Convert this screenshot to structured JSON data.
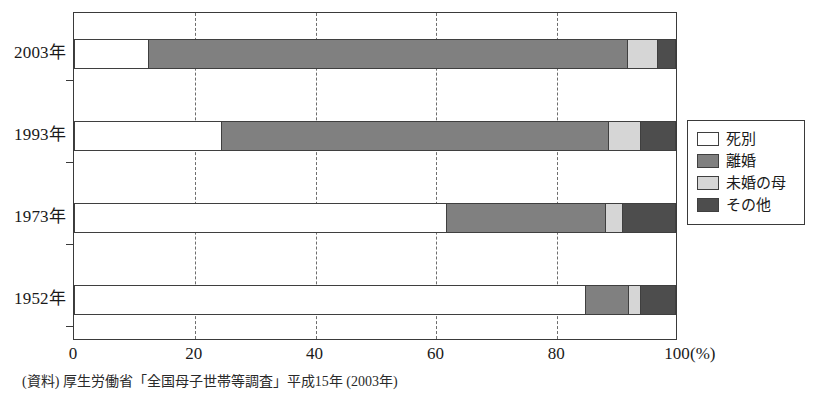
{
  "chart_data": {
    "type": "bar",
    "orientation": "horizontal",
    "stacked": true,
    "stacked_mode": "percent",
    "title": "",
    "subtitle": "",
    "xlabel": "",
    "ylabel": "",
    "xunit": "(%)",
    "xlim": [
      0,
      100
    ],
    "xticks": [
      0,
      20,
      40,
      60,
      80,
      100
    ],
    "xtick_labels": [
      "0",
      "20",
      "40",
      "60",
      "80",
      "100"
    ],
    "grid": "vertical-dashed",
    "legend_position": "right",
    "categories": [
      "2003年",
      "1993年",
      "1973年",
      "1952年"
    ],
    "series": [
      {
        "name": "死別",
        "color": "#ffffff",
        "values": [
          12.5,
          24.6,
          61.9,
          85.1
        ]
      },
      {
        "name": "離婚",
        "color": "#808080",
        "values": [
          79.5,
          64.3,
          26.5,
          7.1
        ]
      },
      {
        "name": "未婚の母",
        "color": "#d6d6d6",
        "values": [
          5.0,
          5.3,
          2.8,
          2.0
        ]
      },
      {
        "name": "その他",
        "color": "#4d4d4d",
        "values": [
          3.0,
          5.8,
          8.8,
          5.8
        ]
      }
    ],
    "annotations": [],
    "source_note": "(資料) 厚生労働省「全国母子世帯等調査」平成15年 (2003年)"
  },
  "legend": {
    "items": [
      {
        "label": "死別"
      },
      {
        "label": "離婚"
      },
      {
        "label": "未婚の母"
      },
      {
        "label": "その他"
      }
    ]
  },
  "axis": {
    "x_tick_labels": [
      "0",
      "20",
      "40",
      "60",
      "80",
      "100"
    ],
    "x_unit_label": "(%)",
    "y_tick_labels": [
      "2003年",
      "1993年",
      "1973年",
      "1952年"
    ]
  },
  "footer": {
    "source": "(資料) 厚生労働省「全国母子世帯等調査」平成15年 (2003年)"
  },
  "colors": {
    "death_separation": "#ffffff",
    "divorce": "#808080",
    "unmarried_mother": "#d6d6d6",
    "other": "#4d4d4d",
    "axis": "#3a3a3a",
    "grid": "#6d6d6d"
  }
}
